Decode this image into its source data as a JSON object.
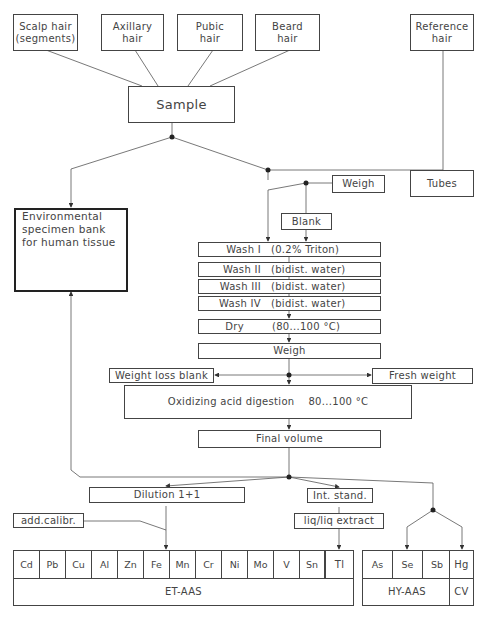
{
  "sources": [
    {
      "id": "scalp",
      "label_line1": "Scalp hair",
      "label_line2": "(segments)"
    },
    {
      "id": "axillary",
      "label_line1": "Axillary",
      "label_line2": "hair"
    },
    {
      "id": "pubic",
      "label_line1": "Pubic",
      "label_line2": "hair"
    },
    {
      "id": "beard",
      "label_line1": "Beard",
      "label_line2": "hair"
    },
    {
      "id": "reference",
      "label_line1": "Reference",
      "label_line2": "hair"
    }
  ],
  "sample": "Sample",
  "specimen_bank": {
    "line1": "Environmental",
    "line2": "specimen bank",
    "line3": "for human tissue"
  },
  "tubes": "Tubes",
  "weigh_tubes": "Weigh",
  "blank": "Blank",
  "washes": [
    {
      "step": "Wash I",
      "condition": "(0.2% Triton)"
    },
    {
      "step": "Wash II",
      "condition": "(bidist. water)"
    },
    {
      "step": "Wash III",
      "condition": "(bidist. water)"
    },
    {
      "step": "Wash IV",
      "condition": "(bidist. water)"
    }
  ],
  "dry": {
    "step": "Dry",
    "condition": "(80...100 °C)"
  },
  "weigh": "Weigh",
  "weight_loss_blank": "Weight loss blank",
  "fresh_weight": "Fresh weight",
  "digestion": {
    "step": "Oxidizing acid digestion",
    "condition": "80...100 °C"
  },
  "final_volume": "Final volume",
  "dilution": "Dilution 1+1",
  "add_calibr": "add.calibr.",
  "int_stand": "Int. stand.",
  "liq_extract": "liq/liq extract",
  "et_aas": {
    "label": "ET-AAS",
    "elements": [
      "Cd",
      "Pb",
      "Cu",
      "Al",
      "Zn",
      "Fe",
      "Mn",
      "Cr",
      "Ni",
      "Mo",
      "V",
      "Sn"
    ],
    "extracted_element": "Tl"
  },
  "hy_aas": {
    "label": "HY-AAS",
    "elements": [
      "As",
      "Se",
      "Sb"
    ]
  },
  "cv": {
    "label": "CV",
    "elements": [
      "Hg"
    ]
  }
}
